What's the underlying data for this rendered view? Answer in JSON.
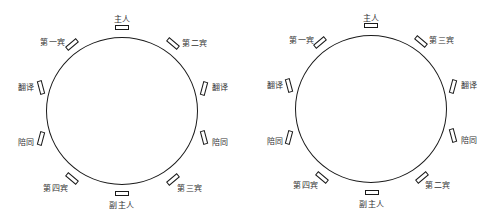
{
  "diagrams": [
    {
      "table": {
        "cx": 122,
        "cy": 111,
        "rx": 76,
        "ry": 74
      },
      "seats": [
        {
          "label": "主人",
          "x": 122,
          "y": 27,
          "rot": 0,
          "lx": 122,
          "ly": 18
        },
        {
          "label": "第一宾",
          "x": 72,
          "y": 44,
          "rot": -40,
          "lx": 53,
          "ly": 41
        },
        {
          "label": "第二宾",
          "x": 173,
          "y": 43,
          "rot": 40,
          "lx": 195,
          "ly": 42
        },
        {
          "label": "翻译",
          "x": 41,
          "y": 87,
          "rot": 75,
          "lx": 26,
          "ly": 86
        },
        {
          "label": "翻译",
          "x": 204,
          "y": 88,
          "rot": -75,
          "lx": 220,
          "ly": 86
        },
        {
          "label": "陪同",
          "x": 41,
          "y": 138,
          "rot": -75,
          "lx": 26,
          "ly": 141
        },
        {
          "label": "陪同",
          "x": 204,
          "y": 137,
          "rot": 75,
          "lx": 220,
          "ly": 141
        },
        {
          "label": "第四宾",
          "x": 72,
          "y": 178,
          "rot": 40,
          "lx": 56,
          "ly": 187
        },
        {
          "label": "第三宾",
          "x": 173,
          "y": 179,
          "rot": -40,
          "lx": 190,
          "ly": 187
        },
        {
          "label": "副主人",
          "x": 122,
          "y": 193,
          "rot": 0,
          "lx": 122,
          "ly": 204
        }
      ]
    },
    {
      "table": {
        "cx": 371,
        "cy": 109,
        "rx": 76,
        "ry": 74
      },
      "seats": [
        {
          "label": "主人",
          "x": 371,
          "y": 25,
          "rot": 0,
          "lx": 371,
          "ly": 17
        },
        {
          "label": "第一宾",
          "x": 320,
          "y": 42,
          "rot": -40,
          "lx": 302,
          "ly": 39
        },
        {
          "label": "第三宾",
          "x": 421,
          "y": 41,
          "rot": 40,
          "lx": 442,
          "ly": 39
        },
        {
          "label": "翻译",
          "x": 289,
          "y": 85,
          "rot": 75,
          "lx": 275,
          "ly": 84
        },
        {
          "label": "翻译",
          "x": 453,
          "y": 86,
          "rot": -75,
          "lx": 469,
          "ly": 84
        },
        {
          "label": "陪同",
          "x": 289,
          "y": 137,
          "rot": -75,
          "lx": 275,
          "ly": 140
        },
        {
          "label": "陪同",
          "x": 453,
          "y": 135,
          "rot": 75,
          "lx": 469,
          "ly": 139
        },
        {
          "label": "第四宾",
          "x": 322,
          "y": 177,
          "rot": 40,
          "lx": 306,
          "ly": 184
        },
        {
          "label": "第二宾",
          "x": 422,
          "y": 177,
          "rot": -40,
          "lx": 438,
          "ly": 184
        },
        {
          "label": "副主人",
          "x": 372,
          "y": 192,
          "rot": 0,
          "lx": 372,
          "ly": 203
        }
      ]
    }
  ]
}
